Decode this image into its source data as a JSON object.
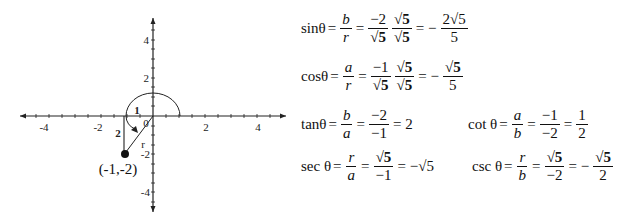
{
  "graph": {
    "x_ticks": [
      "-4",
      "-2",
      "2",
      "4"
    ],
    "y_ticks": [
      "4",
      "2",
      "-2",
      "-4"
    ],
    "origin_label": "0",
    "point_label": "(-1,-2)",
    "horizontal_leg_label": "1",
    "vertical_leg_label": "2",
    "hypotenuse_label": "r"
  },
  "equations": {
    "sin": {
      "fn": "sinθ",
      "eq1": "=",
      "n1": "b",
      "d1": "r",
      "eq2": "=",
      "n2": "−2",
      "d2": "√5",
      "n3": "√5",
      "d3": "√5",
      "eq3": "= −",
      "n4": "2√5",
      "d4": "5"
    },
    "cos": {
      "fn": "cosθ",
      "eq1": "=",
      "n1": "a",
      "d1": "r",
      "eq2": "=",
      "n2": "−1",
      "d2": "√5",
      "n3": "√5",
      "d3": "√5",
      "eq3": "= −",
      "n4": "√5",
      "d4": "5"
    },
    "tan": {
      "fn": "tanθ",
      "eq1": "=",
      "n1": "b",
      "d1": "a",
      "eq2": "=",
      "n2": "−2",
      "d2": "−1",
      "eq3": "= 2"
    },
    "cot": {
      "fn": "cot θ",
      "eq1": "=",
      "n1": "a",
      "d1": "b",
      "eq2": "=",
      "n2": "−1",
      "d2": "−2",
      "eq3": "=",
      "n3": "1",
      "d3": "2"
    },
    "sec": {
      "fn": "sec θ",
      "eq1": "=",
      "n1": "r",
      "d1": "a",
      "eq2": "=",
      "n2": "√5",
      "d2": "−1",
      "eq3": "= −√5"
    },
    "csc": {
      "fn": "csc θ",
      "eq1": "=",
      "n1": "r",
      "d1": "b",
      "eq2": "=",
      "n2": "√5",
      "d2": "−2",
      "eq3": "= −",
      "n3": "√5",
      "d3": "2"
    }
  }
}
